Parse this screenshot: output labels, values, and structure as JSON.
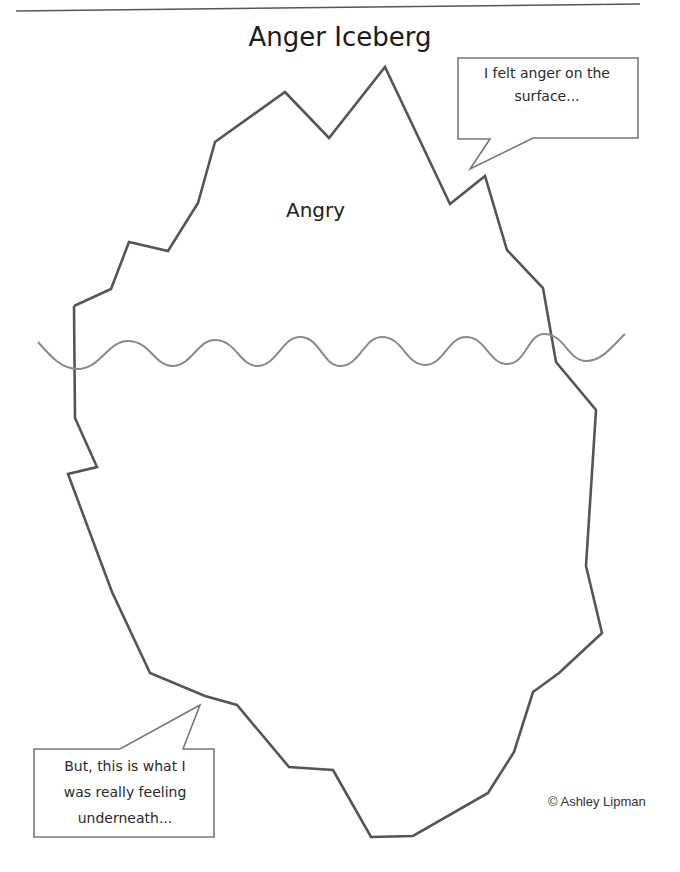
{
  "title": "Anger Iceberg",
  "iceberg": {
    "surface_label": "Angry",
    "outline_color": "#555555",
    "outline_points": "74,306 111,289 129,242 168,251 198,203 215,142 285,92 329,138 385,67 450,204 485,176 507,250 543,288 556,362 596,410 586,566 602,633 559,673 533,692 514,752 488,793 413,836 371,837 333,770 289,767 237,705 205,696 150,673 112,592 68,474 97,467 75,418 74,306"
  },
  "water_line": {
    "color": "#8a8a8a"
  },
  "callouts": {
    "top": {
      "lines": [
        "I felt anger on the",
        "surface..."
      ]
    },
    "bottom": {
      "lines": [
        "But, this is what I",
        "was really feeling",
        "underneath..."
      ]
    }
  },
  "copyright": "© Ashley Lipman"
}
